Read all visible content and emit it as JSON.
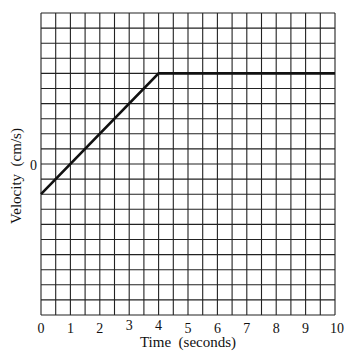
{
  "chart_data": {
    "type": "line",
    "title": "",
    "xlabel": "Time  (seconds)",
    "ylabel": "Velocity  (cm/s)",
    "x_ticks": [
      "0",
      "1",
      "2",
      "3",
      "4",
      "5",
      "6",
      "7",
      "8",
      "9",
      "10"
    ],
    "y_ticks": [
      "0"
    ],
    "xlim": [
      0,
      10
    ],
    "ylim_grid_units": [
      -10,
      10
    ],
    "grid": {
      "on": true,
      "columns": 20,
      "rows": 20,
      "x_per_cell": 0.5,
      "y_per_cell": 1,
      "y_zero_row_from_top": 10
    },
    "series": [
      {
        "name": "velocity",
        "x": [
          0,
          4,
          10
        ],
        "y": [
          -2,
          6,
          6
        ],
        "y_units": "grid divisions (unlabeled scale)"
      }
    ],
    "legend": null,
    "colors": {
      "line": "#111111",
      "grid": "#222222",
      "background": "#ffffff"
    }
  }
}
